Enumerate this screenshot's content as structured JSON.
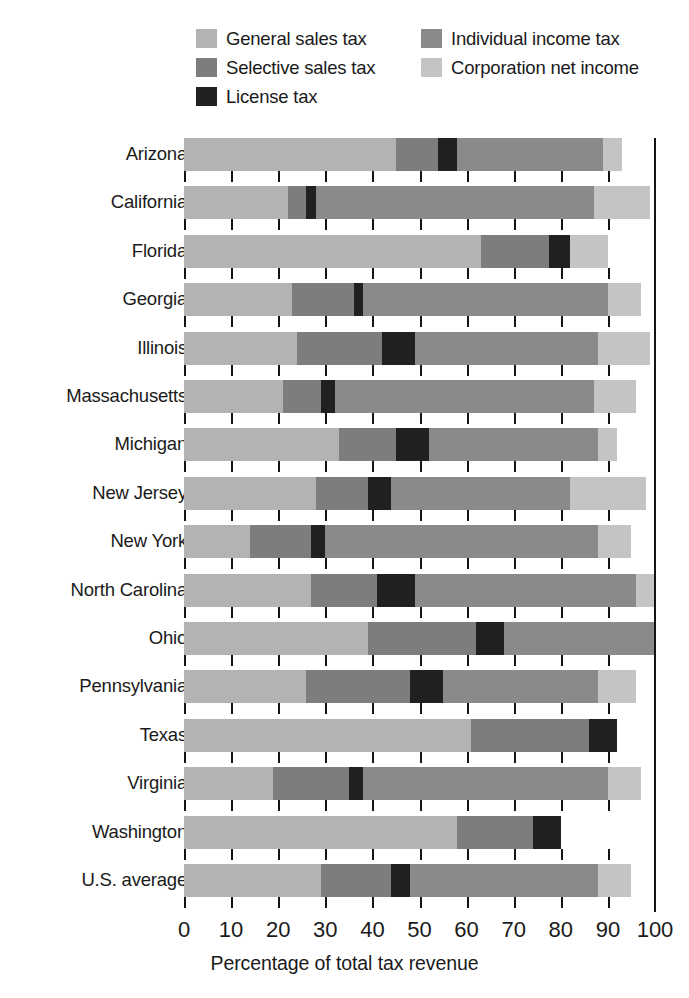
{
  "legend": {
    "items": [
      {
        "label": "General sales tax",
        "color": "#b3b3b3",
        "column": "a"
      },
      {
        "label": "Individual income tax",
        "color": "#8a8a8a",
        "column": "b"
      },
      {
        "label": "Selective sales tax",
        "color": "#7d7d7d",
        "column": "a"
      },
      {
        "label": "Corporation net income",
        "color": "#c4c4c4",
        "column": "b"
      },
      {
        "label": "License tax",
        "color": "#202020",
        "column": "a"
      }
    ]
  },
  "axis": {
    "x_title": "Percentage of total tax revenue",
    "x_ticks": [
      0,
      10,
      20,
      30,
      40,
      50,
      60,
      70,
      80,
      90,
      100
    ],
    "x_min": 0,
    "x_max": 100
  },
  "colors": {
    "general_sales_tax": "#b3b3b3",
    "selective_sales_tax": "#7d7d7d",
    "license_tax": "#202020",
    "individual_income_tax": "#8a8a8a",
    "corporation_net_income": "#c4c4c4",
    "axis": "#141414",
    "text": "#1a1a1a",
    "background": "#ffffff"
  },
  "chart_data": {
    "type": "bar",
    "orientation": "horizontal",
    "stacked": true,
    "title": "",
    "xlabel": "Percentage of total tax revenue",
    "ylabel": "",
    "xlim": [
      0,
      100
    ],
    "grid": false,
    "legend_position": "top",
    "categories": [
      "Arizona",
      "California",
      "Florida",
      "Georgia",
      "Illinois",
      "Massachusetts",
      "Michigan",
      "New Jersey",
      "New York",
      "North Carolina",
      "Ohio",
      "Pennsylvania",
      "Texas",
      "Virginia",
      "Washington",
      "U.S. average"
    ],
    "series": [
      {
        "name": "General sales tax",
        "color": "#b3b3b3",
        "values": [
          45,
          22,
          63,
          23,
          24,
          21,
          33,
          28,
          14,
          27,
          39,
          26,
          61,
          19,
          58,
          29
        ]
      },
      {
        "name": "Selective sales tax",
        "color": "#7d7d7d",
        "values": [
          9,
          4,
          14.5,
          13,
          18,
          8,
          12,
          11,
          13,
          14,
          23,
          22,
          25,
          16,
          16,
          15
        ]
      },
      {
        "name": "License tax",
        "color": "#202020",
        "values": [
          4,
          2,
          4.5,
          2,
          7,
          3,
          7,
          5,
          3,
          8,
          6,
          7,
          6,
          3,
          6,
          4
        ]
      },
      {
        "name": "Individual income tax",
        "color": "#8a8a8a",
        "values": [
          31,
          59,
          0,
          52,
          39,
          55,
          36,
          38,
          58,
          47,
          32,
          33,
          0,
          52,
          0,
          40
        ]
      },
      {
        "name": "Corporation net income",
        "color": "#c4c4c4",
        "values": [
          4,
          12,
          8,
          7,
          11,
          9,
          4,
          16,
          7,
          4,
          0,
          8,
          0,
          7,
          0,
          7
        ]
      }
    ],
    "row_totals": [
      93,
      99,
      90,
      97,
      99,
      96,
      92,
      98,
      95,
      100,
      100,
      96,
      92,
      97,
      80,
      95
    ]
  }
}
